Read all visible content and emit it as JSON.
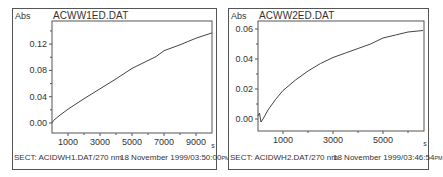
{
  "panels": [
    {
      "ylabel": "Abs",
      "title": "ACWW1ED.DAT",
      "xunit": "s",
      "footer_left": "SECT: ACIDWH1.DAT/270 nm",
      "footer_right": "18 November 1999/03:50:00",
      "footer_ampm": "PM"
    },
    {
      "ylabel": "Abs",
      "title": "ACWW2ED.DAT",
      "xunit": "s",
      "footer_left": "SECT: ACIDWH2.DAT/270 nm",
      "footer_right": "18 November 1999/03:46:54",
      "footer_ampm": "PM"
    }
  ],
  "chart_data": [
    {
      "type": "line",
      "title": "ACWW1ED.DAT",
      "xlabel": "s",
      "ylabel": "Abs",
      "xlim": [
        0,
        10000
      ],
      "ylim": [
        -0.015,
        0.155
      ],
      "xticks": [
        1000,
        3000,
        5000,
        7000,
        9000
      ],
      "yticks": [
        0.0,
        0.04,
        0.08,
        0.12
      ],
      "ytick_labels": [
        "0.00",
        "0.04",
        "0.08",
        "0.12"
      ],
      "grid": false,
      "series": [
        {
          "name": "ACWW1ED.DAT",
          "x": [
            0,
            100,
            500,
            1000,
            2000,
            3000,
            4000,
            5000,
            6000,
            6500,
            7000,
            8000,
            9000,
            10000
          ],
          "y": [
            0.0,
            0.004,
            0.012,
            0.021,
            0.037,
            0.052,
            0.067,
            0.083,
            0.095,
            0.101,
            0.11,
            0.119,
            0.129,
            0.137
          ]
        }
      ],
      "footer": "SECT: ACIDWH1.DAT/270 nm   18 November 1999/03:50:00PM"
    },
    {
      "type": "line",
      "title": "ACWW2ED.DAT",
      "xlabel": "s",
      "ylabel": "Abs",
      "xlim": [
        0,
        6600
      ],
      "ylim": [
        -0.008,
        0.066
      ],
      "xticks": [
        1000,
        3000,
        5000
      ],
      "yticks": [
        0.0,
        0.02,
        0.04,
        0.06
      ],
      "ytick_labels": [
        "0.00",
        "0.02",
        "0.04",
        "0.06"
      ],
      "grid": false,
      "series": [
        {
          "name": "ACWW2ED.DAT",
          "x": [
            0,
            60,
            120,
            200,
            400,
            700,
            1000,
            1500,
            2000,
            2500,
            3000,
            3500,
            4000,
            4500,
            5000,
            5500,
            6000,
            6600
          ],
          "y": [
            0.002,
            0.004,
            -0.002,
            0.0,
            0.006,
            0.013,
            0.019,
            0.026,
            0.032,
            0.037,
            0.041,
            0.044,
            0.047,
            0.05,
            0.054,
            0.056,
            0.058,
            0.059
          ]
        }
      ],
      "footer": "SECT: ACIDWH2.DAT/270 nm   18 November 1999/03:46:54PM"
    }
  ]
}
